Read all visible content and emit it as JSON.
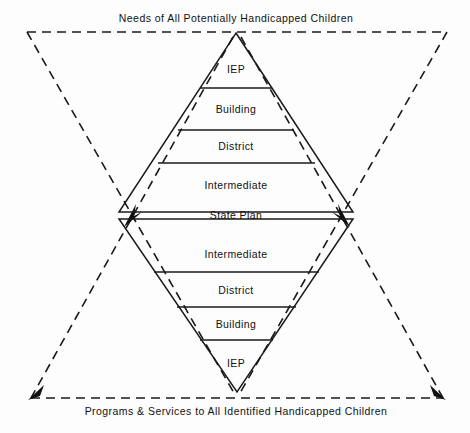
{
  "diagram": {
    "type": "bowtie-hourglass-planning-diagram",
    "top_caption": "Needs of All Potentially Handicapped Children",
    "bottom_caption": "Programs & Services to All Identified Handicapped Children",
    "upper_triangle_bands": [
      {
        "label": "IEP"
      },
      {
        "label": "Building"
      },
      {
        "label": "District"
      },
      {
        "label": "Intermediate"
      }
    ],
    "middle_band": {
      "label": "State Plan"
    },
    "lower_triangle_bands": [
      {
        "label": "Intermediate"
      },
      {
        "label": "District"
      },
      {
        "label": "Building"
      },
      {
        "label": "IEP"
      }
    ],
    "colors": {
      "line": "#1a1a1a",
      "text": "#111111",
      "background": "#fdfdfd"
    }
  }
}
